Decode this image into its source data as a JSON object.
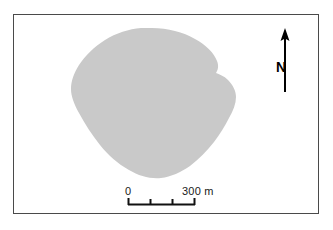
{
  "figure": {
    "type": "map",
    "frame": {
      "border_color": "#4a4a4a",
      "background_color": "#ffffff"
    }
  },
  "landmass": {
    "name": "island-polygon",
    "fill_color": "#c9c9c9",
    "outline": "none"
  },
  "scale_bar": {
    "name": "scale-bar",
    "zero_label": "0",
    "max_label": "300 m",
    "units": "m",
    "min_value": 0,
    "max_value": 300,
    "tick_count": 4,
    "tick_values": [
      0,
      100,
      200,
      300
    ],
    "bar_color": "#111111"
  },
  "north_arrow": {
    "name": "north-arrow",
    "letter": "N",
    "direction": "up",
    "color": "#000000"
  }
}
